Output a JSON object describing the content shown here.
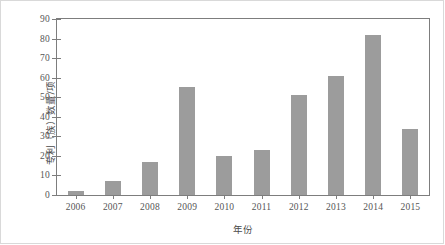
{
  "chart_data": {
    "type": "bar",
    "title": "",
    "xlabel": "年份",
    "ylabel": "专利（族）数量/项",
    "categories": [
      "2006",
      "2007",
      "2008",
      "2009",
      "2010",
      "2011",
      "2012",
      "2013",
      "2014",
      "2015"
    ],
    "values": [
      2,
      7,
      17,
      55,
      20,
      23,
      51,
      61,
      82,
      34
    ],
    "ylim": [
      0,
      90
    ],
    "ytick_labels": [
      "0",
      "10",
      "20",
      "30",
      "40",
      "50",
      "60",
      "70",
      "80",
      "90"
    ],
    "ytick_values": [
      0,
      10,
      20,
      30,
      40,
      50,
      60,
      70,
      80,
      90
    ],
    "grid": false,
    "legend": null,
    "bar_color": "#9c9c9c",
    "axis_color": "#7d7d7d",
    "background_color": "#ffffff"
  }
}
